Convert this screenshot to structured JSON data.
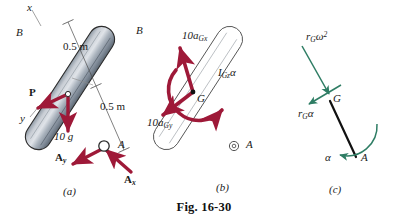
{
  "figure": {
    "caption": "Fig. 16-30",
    "colors": {
      "force_arrow": "#9e1938",
      "accel_arrow": "#2e7d64",
      "bar_fill_light": "#c9ced6",
      "bar_fill_dark": "#6f7c88",
      "bar_outline": "#2b2b2b",
      "dimension_line": "#4a4a4a",
      "text": "#1a1a1a"
    }
  },
  "panel_a": {
    "caption": "(a)",
    "axis_x": "x",
    "axis_y": "y",
    "point_b": "B",
    "point_a": "A",
    "dim_upper": "0.5 m",
    "dim_lower": "0.5 m",
    "force_p": "P",
    "weight": "10 g",
    "reaction_ay_main": "A",
    "reaction_ay_sub": "y",
    "reaction_ax_main": "A",
    "reaction_ax_sub": "x"
  },
  "panel_b": {
    "caption": "(b)",
    "point_b": "B",
    "point_a": "A",
    "point_g": "G",
    "ma_x_main": "10a",
    "ma_x_sub": "Gx",
    "ma_y_main": "10a",
    "ma_y_sub": "Gy",
    "moment_main": "I",
    "moment_sub": "Gz",
    "moment_alpha": "α"
  },
  "panel_c": {
    "caption": "(c)",
    "point_g": "G",
    "point_a": "A",
    "normal_main": "r",
    "normal_sub": "G",
    "normal_omega": "ω",
    "normal_exp": "2",
    "tangential_main": "r",
    "tangential_sub": "G",
    "tangential_alpha": "α",
    "alpha_label": "α"
  }
}
